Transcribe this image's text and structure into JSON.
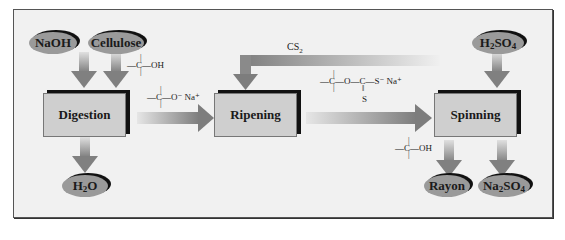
{
  "diagram": {
    "inputs": [
      {
        "id": "naoh",
        "label": "NaOH"
      },
      {
        "id": "cellulose",
        "label": "Cellulose"
      },
      {
        "id": "h2so4",
        "label": "H2SO4",
        "parts": [
          "H",
          "2",
          "SO",
          "4"
        ]
      }
    ],
    "outputs": [
      {
        "id": "h2o",
        "label": "H2O",
        "parts": [
          "H",
          "2",
          "O"
        ]
      },
      {
        "id": "rayon",
        "label": "Rayon"
      },
      {
        "id": "na2so4",
        "label": "Na2SO4",
        "parts": [
          "Na",
          "2",
          "SO",
          "4"
        ]
      }
    ],
    "steps": [
      {
        "id": "digestion",
        "label": "Digestion"
      },
      {
        "id": "ripening",
        "label": "Ripening"
      },
      {
        "id": "spinning",
        "label": "Spinning"
      }
    ],
    "reagent_recycle": {
      "label": "CS2",
      "parts": [
        "CS",
        "2"
      ]
    },
    "structures": {
      "cellulose_oh": "—C—OH",
      "alkoxide": "—C—O⁻ Na⁺",
      "xanthate_top": "—C—O—C—S⁻ Na⁺",
      "xanthate_bottom": "S",
      "rayon_oh": "—C—OH"
    },
    "colors": {
      "background": "#f1f1f1",
      "oval_fill": "#9a9a9a",
      "box_fill": "#cfcfcf",
      "arrow": "#8a8a8a",
      "shadow": "#111111"
    }
  }
}
